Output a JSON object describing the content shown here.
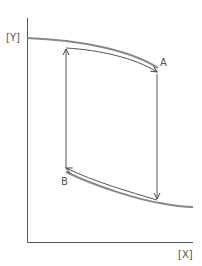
{
  "diagram": {
    "axis_labels": {
      "y": "[Y]",
      "x": "[X]"
    },
    "points": {
      "a": "A",
      "b": "B"
    },
    "colors": {
      "curve": "#777777",
      "axis": "#444444",
      "arrow": "#555555"
    }
  }
}
